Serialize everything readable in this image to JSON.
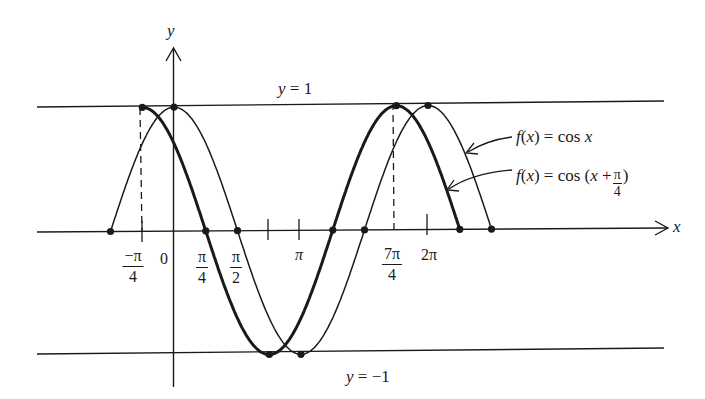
{
  "diagram": {
    "axes": {
      "x_label": "x",
      "y_label": "y",
      "origin_label": "0"
    },
    "reference_lines": {
      "upper": "y = 1",
      "lower": "y = −1"
    },
    "tick_labels": [
      {
        "key": "neg_pi_4",
        "num": "−π",
        "den": "4",
        "type": "fraction"
      },
      {
        "key": "zero",
        "text": "0",
        "type": "text"
      },
      {
        "key": "pi_4",
        "num": "π",
        "den": "4",
        "type": "fraction"
      },
      {
        "key": "pi_2",
        "num": "π",
        "den": "2",
        "type": "fraction"
      },
      {
        "key": "pi",
        "text": "π",
        "type": "text"
      },
      {
        "key": "7pi_4",
        "num": "7π",
        "den": "4",
        "type": "fraction"
      },
      {
        "key": "2pi",
        "text": "2π",
        "type": "text"
      }
    ],
    "curves": [
      {
        "name": "f(x) = cos x",
        "label_prefix": "f(x) = cos x",
        "stroke": "thin",
        "domain": "[−π/2, 5π/2]",
        "marked_points": [
          "(−π/2, 0)",
          "(0, 1)",
          "(π/2, 0)",
          "(π, −1)",
          "(3π/2, 0)",
          "(2π, 1)",
          "(5π/2, 0)"
        ]
      },
      {
        "name": "f(x) = cos (x + π/4)",
        "label_prefix": "f(x) = cos (x +",
        "label_frac_num": "π",
        "label_frac_den": "4",
        "label_suffix": ")",
        "stroke": "thick",
        "domain": "[−π/4, 9π/4]",
        "marked_points": [
          "(−π/4, 1)",
          "(π/4, 0)",
          "(3π/4, −1)",
          "(5π/4, 0)",
          "(7π/4, 1)",
          "(9π/4, 0)"
        ]
      }
    ],
    "colors": {
      "ink": "#1a1a1a",
      "background": "#ffffff"
    }
  }
}
